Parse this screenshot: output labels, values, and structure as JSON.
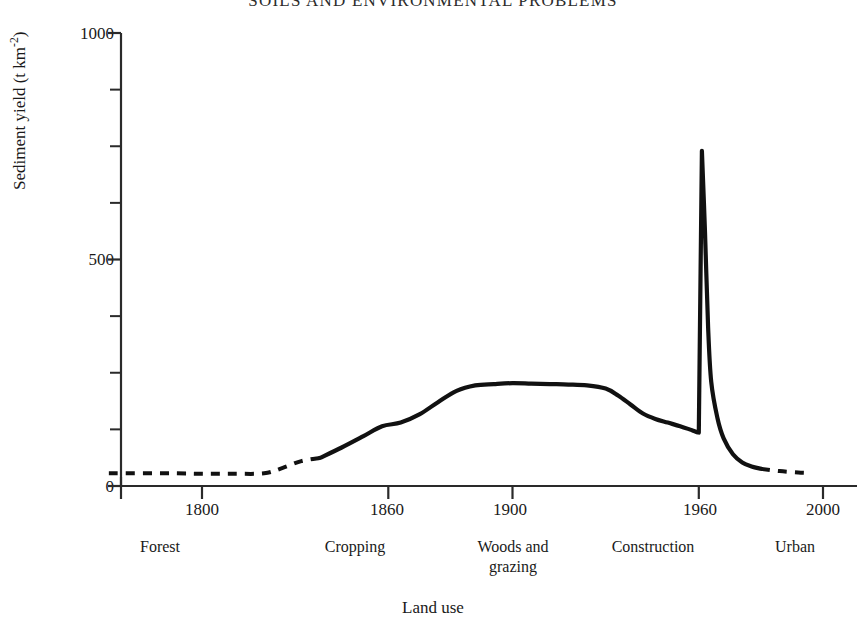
{
  "page": {
    "running_header": "SOILS AND ENVIRONMENTAL PROBLEMS"
  },
  "chart_data": {
    "type": "line",
    "title": "",
    "xlabel": "Land use",
    "ylabel": "Sediment yield (t km-2)",
    "ylabel_base": "Sediment yield (t km",
    "ylabel_exponent": "-2",
    "ylabel_tail": ")",
    "xlim": [
      1770,
      2010
    ],
    "ylim": [
      0,
      1000
    ],
    "grid": false,
    "legend": "none",
    "x_ticks": [
      1800,
      1860,
      1900,
      1960,
      2000
    ],
    "x_tick_labels": [
      "1800",
      "1860",
      "1900",
      "1960",
      "2000"
    ],
    "y_ticks": [
      0,
      500,
      1000
    ],
    "y_tick_labels": [
      "0",
      "500",
      "1000"
    ],
    "y_minor_ticks": [
      125,
      250,
      375,
      625,
      750,
      875
    ],
    "category_bands": [
      {
        "label": "Forest",
        "center_year": 1793,
        "start_year": 1770,
        "end_year": 1820
      },
      {
        "label": "Cropping",
        "center_year": 1858,
        "start_year": 1820,
        "end_year": 1890
      },
      {
        "label": "Woods and\ngrazing",
        "center_year": 1908,
        "start_year": 1890,
        "end_year": 1940
      },
      {
        "label": "Construction",
        "center_year": 1952,
        "start_year": 1940,
        "end_year": 1968
      },
      {
        "label": "Urban",
        "center_year": 1992,
        "start_year": 1968,
        "end_year": 2010
      }
    ],
    "series": [
      {
        "name": "Sediment yield",
        "style": "dashed",
        "segment": "pre-record",
        "x": [
          1770,
          1790,
          1800,
          1810,
          1820,
          1826,
          1832,
          1838
        ],
        "values": [
          28,
          28,
          27,
          27,
          28,
          40,
          55,
          62
        ]
      },
      {
        "name": "Sediment yield",
        "style": "solid",
        "segment": "record",
        "x": [
          1838,
          1845,
          1852,
          1858,
          1864,
          1870,
          1876,
          1882,
          1888,
          1894,
          1900,
          1906,
          1912,
          1918,
          1924,
          1930,
          1934,
          1938,
          1942,
          1946,
          1950,
          1954,
          1957,
          1959,
          1960,
          1961,
          1962,
          1963,
          1964,
          1966,
          1968,
          1971,
          1974,
          1977,
          1980
        ],
        "values": [
          62,
          85,
          110,
          132,
          140,
          158,
          185,
          210,
          222,
          225,
          227,
          226,
          225,
          224,
          222,
          215,
          200,
          180,
          160,
          148,
          140,
          132,
          125,
          120,
          118,
          740,
          560,
          350,
          230,
          150,
          105,
          70,
          52,
          43,
          38
        ]
      },
      {
        "name": "Sediment yield",
        "style": "dashed",
        "segment": "post-record",
        "x": [
          1980,
          1986,
          1992,
          1996
        ],
        "values": [
          38,
          33,
          30,
          29
        ]
      }
    ],
    "peak": {
      "year": 1961,
      "value": 740,
      "label": "Construction peak"
    },
    "plateau": {
      "start_year": 1888,
      "end_year": 1918,
      "value": 225
    },
    "baseline_forest": 28
  }
}
